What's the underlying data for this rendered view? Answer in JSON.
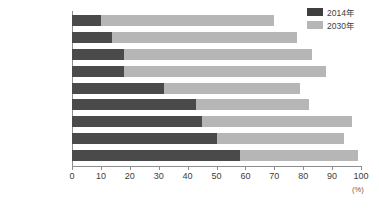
{
  "chart_data": {
    "type": "bar",
    "orientation": "horizontal",
    "title": "",
    "subtitle": "",
    "xlabel": "(%)",
    "ylabel": "",
    "xlim": [
      0,
      100
    ],
    "xticks": [
      0,
      10,
      20,
      30,
      40,
      50,
      60,
      70,
      80,
      90,
      100
    ],
    "xtick_labels": [
      "0",
      "10",
      "20",
      "30",
      "40",
      "50",
      "60",
      "70",
      "80",
      "90",
      "100"
    ],
    "grid": false,
    "legend_position": "top-right",
    "categories": [
      "バングラデシュ",
      "パキスタン",
      "インドネシア",
      "ナイジェリア",
      "インド",
      "エジプト",
      "メキシコ",
      "中国",
      "ブラジル"
    ],
    "series": [
      {
        "name": "2014年",
        "color": "#4a4a4a",
        "values": [
          10,
          14,
          18,
          18,
          32,
          43,
          45,
          50,
          58
        ]
      },
      {
        "name": "2030年",
        "color": "#b6b6b6",
        "values": [
          70,
          78,
          83,
          88,
          79,
          82,
          97,
          94,
          99
        ]
      }
    ],
    "unit": "(%)"
  },
  "legend": {
    "items": [
      {
        "label": "2014年",
        "color": "#3f3f3f"
      },
      {
        "label": "2030年",
        "color": "#b6b6b6"
      }
    ]
  },
  "axis": {
    "unit_label": "(%)"
  }
}
